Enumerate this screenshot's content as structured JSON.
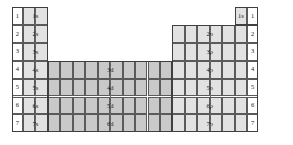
{
  "diagram": {
    "row_numbers_left": [
      "1",
      "2",
      "3",
      "4",
      "5",
      "6",
      "7"
    ],
    "row_numbers_right": [
      "1",
      "2",
      "3",
      "4",
      "5",
      "6",
      "7"
    ],
    "blocks": {
      "s": {
        "label_color": "#1a1a1a",
        "fill": "#e2e2e2",
        "columns": 2,
        "labels": [
          "1s",
          "2s",
          "3s",
          "4s",
          "5s",
          "6s",
          "7s"
        ]
      },
      "p": {
        "fill": "#e2e2e2",
        "columns": 6,
        "labels": [
          "1s",
          "2p",
          "3p",
          "4p",
          "5p",
          "6p",
          "7p"
        ]
      },
      "d": {
        "fill": "#c9c9c9",
        "columns": 10,
        "labels": [
          "3d",
          "4d",
          "5d",
          "6d"
        ]
      }
    },
    "colors": {
      "background": "#ffffff",
      "grid_line": "#5a5a5a",
      "frame_line": "#3f3f3f",
      "s_fill": "#e2e2e2",
      "p_fill": "#e2e2e2",
      "d_fill": "#c9c9c9",
      "plain_fill": "#f7f7f7",
      "text": "#1a1a1a"
    }
  }
}
